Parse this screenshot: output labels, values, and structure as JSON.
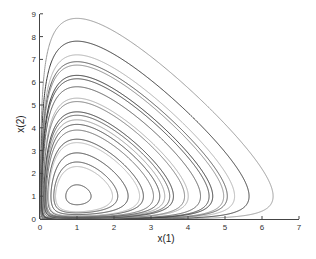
{
  "chart_data": {
    "type": "line",
    "subtype": "phase-portrait",
    "title": "",
    "xlabel": "x(1)",
    "ylabel": "x(2)",
    "xlim": [
      0,
      7
    ],
    "ylim": [
      0,
      9
    ],
    "xticks": [
      0,
      1,
      2,
      3,
      4,
      5,
      6,
      7
    ],
    "yticks": [
      0,
      1,
      2,
      3,
      4,
      5,
      6,
      7,
      8,
      9
    ],
    "grid": false,
    "legend": null,
    "equilibrium": [
      1,
      1
    ],
    "series": [
      {
        "name": "orbit-1",
        "y_peak": 8.8,
        "x_max": 6.3,
        "shade": "#9a9a9a"
      },
      {
        "name": "orbit-2",
        "y_peak": 7.8,
        "x_max": 5.9,
        "shade": "#3a3a3a"
      },
      {
        "name": "orbit-3",
        "y_peak": 7.2,
        "x_max": 5.6,
        "shade": "#b0b0b0"
      },
      {
        "name": "orbit-4",
        "y_peak": 6.9,
        "x_max": 5.5,
        "shade": "#555555"
      },
      {
        "name": "orbit-5",
        "y_peak": 6.75,
        "x_max": 5.4,
        "shade": "#888888"
      },
      {
        "name": "orbit-6",
        "y_peak": 6.3,
        "x_max": 5.2,
        "shade": "#2e2e2e"
      },
      {
        "name": "orbit-7",
        "y_peak": 6.15,
        "x_max": 5.1,
        "shade": "#444444"
      },
      {
        "name": "orbit-8",
        "y_peak": 5.8,
        "x_max": 4.95,
        "shade": "#5a5a5a"
      },
      {
        "name": "orbit-9",
        "y_peak": 5.3,
        "x_max": 4.7,
        "shade": "#aaaaaa"
      },
      {
        "name": "orbit-10",
        "y_peak": 5.15,
        "x_max": 4.6,
        "shade": "#777777"
      },
      {
        "name": "orbit-11",
        "y_peak": 4.7,
        "x_max": 4.4,
        "shade": "#333333"
      },
      {
        "name": "orbit-12",
        "y_peak": 4.55,
        "x_max": 4.3,
        "shade": "#555555"
      },
      {
        "name": "orbit-13",
        "y_peak": 4.35,
        "x_max": 4.2,
        "shade": "#999999"
      },
      {
        "name": "orbit-14",
        "y_peak": 4.15,
        "x_max": 4.1,
        "shade": "#444444"
      },
      {
        "name": "orbit-15",
        "y_peak": 3.9,
        "x_max": 3.9,
        "shade": "#666666"
      },
      {
        "name": "orbit-16",
        "y_peak": 3.5,
        "x_max": 3.7,
        "shade": "#3c3c3c"
      },
      {
        "name": "orbit-17",
        "y_peak": 3.35,
        "x_max": 3.6,
        "shade": "#b5b5b5"
      },
      {
        "name": "orbit-18",
        "y_peak": 2.9,
        "x_max": 3.3,
        "shade": "#3a3a3a"
      },
      {
        "name": "orbit-19",
        "y_peak": 2.5,
        "x_max": 3.0,
        "shade": "#444444"
      },
      {
        "name": "orbit-20",
        "y_peak": 2.3,
        "x_max": 2.9,
        "shade": "#b0b0b0"
      },
      {
        "name": "orbit-21",
        "y_peak": 1.5,
        "x_max": 1.6,
        "shade": "#444444"
      }
    ]
  },
  "plot_area": {
    "origin_px": [
      40,
      219
    ],
    "px_per_x": 37,
    "px_per_y": 22.8
  }
}
